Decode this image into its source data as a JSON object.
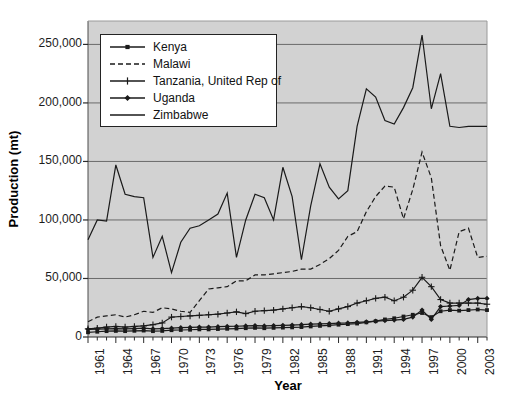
{
  "chart_data": {
    "type": "line",
    "title": "",
    "xlabel": "Year",
    "ylabel": "Production (mt)",
    "ylim": [
      0,
      270000
    ],
    "xlim": [
      1961,
      2004
    ],
    "ytick_values": [
      0,
      50000,
      100000,
      150000,
      200000,
      250000
    ],
    "ytick_labels": [
      "0",
      "50,000",
      "100,000",
      "150,000",
      "200,000",
      "250,000"
    ],
    "grid": "horizontal",
    "legend_position": "upper-left-inside",
    "plot_background": "#d2d2d2",
    "line_color": "#1a1a1a",
    "x": [
      1961,
      1962,
      1963,
      1964,
      1965,
      1966,
      1967,
      1968,
      1969,
      1970,
      1971,
      1972,
      1973,
      1974,
      1975,
      1976,
      1977,
      1978,
      1979,
      1980,
      1981,
      1982,
      1983,
      1984,
      1985,
      1986,
      1987,
      1988,
      1989,
      1990,
      1991,
      1992,
      1993,
      1994,
      1995,
      1996,
      1997,
      1998,
      1999,
      2000,
      2001,
      2002,
      2003,
      2004
    ],
    "xtick_labels": [
      "1961",
      "1964",
      "1967",
      "1970",
      "1973",
      "1976",
      "1979",
      "1982",
      "1985",
      "1988",
      "1991",
      "1994",
      "1997",
      "2000",
      "2003"
    ],
    "xtick_values": [
      1961,
      1964,
      1967,
      1970,
      1973,
      1976,
      1979,
      1982,
      1985,
      1988,
      1991,
      1994,
      1997,
      2000,
      2003
    ],
    "series": [
      {
        "name": "Kenya",
        "style": "solid-square-marker",
        "marker": "square",
        "values": [
          4000,
          4500,
          5000,
          5200,
          5000,
          5300,
          5500,
          5000,
          5200,
          5800,
          6000,
          6200,
          6500,
          6500,
          6800,
          7000,
          7200,
          7500,
          7800,
          7500,
          7800,
          8000,
          8200,
          8500,
          9000,
          9500,
          10000,
          10500,
          11000,
          11500,
          12500,
          13500,
          15000,
          16000,
          17500,
          19000,
          20500,
          17000,
          22000,
          23000,
          22500,
          23000,
          23500,
          23000
        ]
      },
      {
        "name": "Malawi",
        "style": "dashed",
        "marker": "none",
        "values": [
          13000,
          17000,
          18000,
          19000,
          17000,
          19000,
          22000,
          21000,
          25000,
          24000,
          22000,
          21000,
          31000,
          41000,
          42000,
          43000,
          48000,
          48000,
          53000,
          53000,
          54000,
          55000,
          56000,
          58000,
          58000,
          62000,
          67000,
          74000,
          86000,
          90000,
          107000,
          120000,
          129000,
          128000,
          101000,
          126000,
          158000,
          136000,
          78000,
          57000,
          90000,
          93000,
          68000,
          69000
        ]
      },
      {
        "name": "Tanzania, United Rep of",
        "style": "solid-plus-marker",
        "marker": "plus",
        "values": [
          7000,
          7500,
          8500,
          9000,
          8500,
          9000,
          9500,
          10500,
          12000,
          17000,
          17500,
          18000,
          18500,
          19000,
          19500,
          20500,
          21500,
          20000,
          22000,
          22500,
          23000,
          24000,
          25000,
          26000,
          25000,
          23500,
          22000,
          24000,
          26000,
          29000,
          31000,
          33000,
          34000,
          31000,
          34000,
          40000,
          51000,
          43000,
          32000,
          29000,
          29000,
          29000,
          29000,
          28000
        ]
      },
      {
        "name": "Uganda",
        "style": "solid-diamond-marker",
        "marker": "diamond",
        "values": [
          6500,
          6800,
          7000,
          7200,
          7000,
          7200,
          7500,
          7000,
          7200,
          7500,
          8000,
          8200,
          8500,
          8500,
          8800,
          9000,
          9200,
          9500,
          9800,
          9500,
          9800,
          10000,
          10200,
          10500,
          11000,
          11200,
          11500,
          11800,
          12000,
          12500,
          13000,
          13500,
          14000,
          14500,
          15000,
          17000,
          23000,
          15000,
          26000,
          26500,
          27000,
          32000,
          33000,
          33000
        ]
      },
      {
        "name": "Zimbabwe",
        "style": "solid",
        "marker": "none",
        "values": [
          83000,
          100000,
          99000,
          147000,
          122000,
          120000,
          119000,
          68000,
          86000,
          55000,
          81000,
          93000,
          95000,
          100000,
          105000,
          123000,
          68000,
          100000,
          122000,
          119000,
          100000,
          145000,
          120000,
          66000,
          112000,
          148000,
          128000,
          118000,
          125000,
          180000,
          212000,
          205000,
          185000,
          182000,
          196000,
          213000,
          258000,
          195000,
          225000,
          180000,
          179000,
          180000,
          180000,
          180000
        ]
      }
    ]
  },
  "legend": {
    "entries": [
      {
        "label": "Kenya"
      },
      {
        "label": "Malawi"
      },
      {
        "label": "Tanzania, United Rep of"
      },
      {
        "label": "Uganda"
      },
      {
        "label": "Zimbabwe"
      }
    ]
  }
}
